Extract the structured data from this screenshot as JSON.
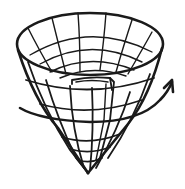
{
  "figure": {
    "style": "black ink line drawing on white background",
    "ink_color": "#1a1a1a",
    "background_color": "#ffffff",
    "elements": [
      {
        "name": "cone-rim",
        "description": "elliptical open top rim of the cone"
      },
      {
        "name": "cone-mesh",
        "description": "grid of meridian and latitude lines on the cone surface"
      },
      {
        "name": "inner-fold",
        "description": "folded inner flap visible inside the cone"
      },
      {
        "name": "cone-apex",
        "description": "pointed bottom tip of the cone"
      },
      {
        "name": "rotation-arrow",
        "description": "curved arrow wrapping around the cone indicating rotation, arrowhead pointing up-right"
      }
    ],
    "text_labels": []
  }
}
